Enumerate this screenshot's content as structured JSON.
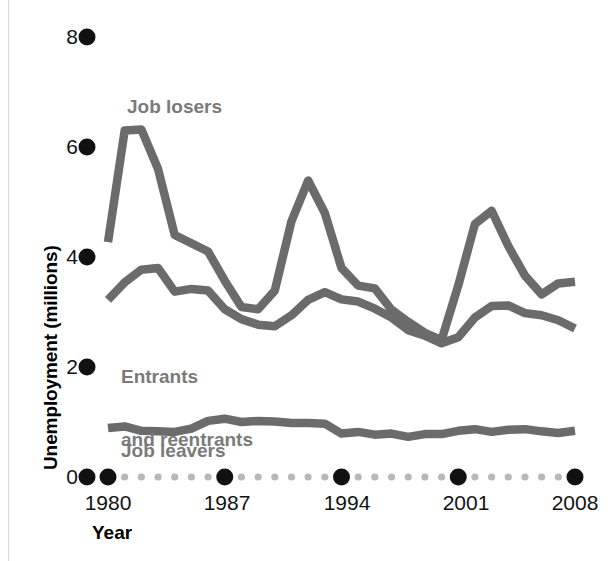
{
  "chart_data": {
    "type": "line",
    "title": "",
    "xlabel": "Year",
    "ylabel": "Unemployment (millions)",
    "xlim": [
      1979.4,
      2008.4
    ],
    "ylim": [
      0,
      8
    ],
    "grid": false,
    "legend_position": "inline-annotations",
    "x_major_ticks": [
      1980,
      1987,
      1994,
      2001,
      2008
    ],
    "x_major_tick_labels": [
      "1980",
      "1987",
      "1994",
      "2001",
      "2008"
    ],
    "x_minor_ticks": [
      1981,
      1982,
      1983,
      1984,
      1985,
      1986,
      1988,
      1989,
      1990,
      1991,
      1992,
      1993,
      1995,
      1996,
      1997,
      1998,
      1999,
      2000,
      2002,
      2003,
      2004,
      2005,
      2006,
      2007
    ],
    "y_ticks": [
      0,
      2,
      4,
      6,
      8
    ],
    "y_tick_labels": [
      "0",
      "2",
      "4",
      "6",
      "8"
    ],
    "x": [
      1980,
      1981,
      1982,
      1983,
      1984,
      1985,
      1986,
      1987,
      1988,
      1989,
      1990,
      1991,
      1992,
      1993,
      1994,
      1995,
      1996,
      1997,
      1998,
      1999,
      2000,
      2001,
      2002,
      2003,
      2004,
      2005,
      2006,
      2007,
      2008
    ],
    "series": [
      {
        "name": "Job losers",
        "color": "#6b6b6b",
        "values": [
          4.27,
          6.3,
          6.32,
          5.6,
          4.4,
          4.25,
          4.1,
          3.57,
          3.09,
          3.05,
          3.39,
          4.65,
          5.39,
          4.8,
          3.8,
          3.48,
          3.43,
          3.04,
          2.82,
          2.62,
          2.49,
          3.48,
          4.6,
          4.84,
          4.2,
          3.66,
          3.32,
          3.52,
          3.55
        ]
      },
      {
        "name": "Entrants and reentrants",
        "color": "#6b6b6b",
        "values": [
          3.22,
          3.54,
          3.77,
          3.8,
          3.37,
          3.42,
          3.39,
          3.05,
          2.87,
          2.77,
          2.74,
          2.94,
          3.22,
          3.36,
          3.23,
          3.19,
          3.06,
          2.9,
          2.67,
          2.57,
          2.43,
          2.54,
          2.9,
          3.11,
          3.12,
          2.98,
          2.94,
          2.85,
          2.7
        ]
      },
      {
        "name": "Job leavers",
        "color": "#6b6b6b",
        "values": [
          0.89,
          0.92,
          0.84,
          0.83,
          0.82,
          0.88,
          1.02,
          1.06,
          1.0,
          1.02,
          1.01,
          0.98,
          0.98,
          0.97,
          0.79,
          0.82,
          0.77,
          0.79,
          0.73,
          0.78,
          0.78,
          0.84,
          0.87,
          0.82,
          0.86,
          0.87,
          0.83,
          0.8,
          0.84
        ]
      }
    ],
    "annotations": [
      {
        "text": "Job losers",
        "x": 1982.1,
        "y": 7.05
      },
      {
        "text": "Entrants\nand reentrants",
        "x": 1981.5,
        "y": 2.85
      },
      {
        "text": "Job leavers",
        "x": 1981.6,
        "y": 0.52
      }
    ]
  },
  "axis": {
    "y_title": "Unemployment (millions)",
    "x_title": "Year",
    "y_tick_labels": [
      "8",
      "6",
      "4",
      "2",
      "0"
    ],
    "x_tick_labels": [
      "1980",
      "1987",
      "1994",
      "2001",
      "2008"
    ]
  },
  "annotations": {
    "job_losers": "Job losers",
    "entrants_line1": "Entrants",
    "entrants_line2": "and reentrants",
    "job_leavers": "Job leavers"
  },
  "colors": {
    "line": "#6b6b6b",
    "annotation_text": "#7a7a7a",
    "axis_text": "#121212",
    "axis_title": "#000000",
    "major_tick_dot": "#111111",
    "minor_tick_dot": "#b8b8b8",
    "background": "#ffffff"
  }
}
